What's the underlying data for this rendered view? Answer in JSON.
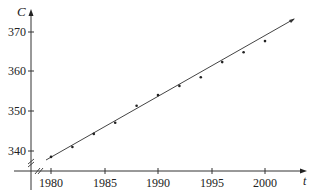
{
  "chart_data": {
    "type": "scatter",
    "title": "",
    "xlabel": "t",
    "ylabel": "C",
    "x": [
      1980,
      1982,
      1984,
      1986,
      1988,
      1990,
      1992,
      1994,
      1996,
      1998,
      2000
    ],
    "series": [
      {
        "name": "data points",
        "values": [
          338.5,
          341.0,
          344.3,
          347.1,
          351.4,
          354.1,
          356.4,
          358.6,
          362.4,
          364.9,
          367.7
        ]
      }
    ],
    "fit_line": {
      "x": [
        1979.5,
        2002.5
      ],
      "y": [
        337.7,
        373.2
      ],
      "label": "linear model"
    },
    "x_ticks": [
      1980,
      1985,
      1990,
      1995,
      2000
    ],
    "y_ticks": [
      340,
      350,
      360,
      370
    ],
    "xlim": [
      1977,
      2004
    ],
    "ylim": [
      335,
      375
    ],
    "axis_breaks": true,
    "grid": false,
    "legend": "none"
  },
  "axes": {
    "y_label": "C",
    "x_label": "t",
    "y_tick_labels": [
      "370",
      "360",
      "350",
      "340"
    ],
    "x_tick_labels": [
      "1980",
      "1985",
      "1990",
      "1995",
      "2000"
    ]
  },
  "colors": {
    "ink": "#333333",
    "background": "#ffffff"
  }
}
